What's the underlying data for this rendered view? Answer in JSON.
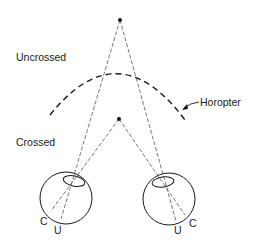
{
  "diagram": {
    "labels": {
      "uncrossed": "Uncrossed",
      "crossed": "Crossed",
      "horopter": "Horopter",
      "left_eye_c": "C",
      "left_eye_u": "U",
      "right_eye_u": "U",
      "right_eye_c": "C"
    },
    "points": {
      "far_point": {
        "x": 120,
        "y": 20
      },
      "near_point": {
        "x": 119,
        "y": 119
      }
    },
    "eyes": [
      {
        "name": "left-eye",
        "cx": 66,
        "cy": 198,
        "r": 26,
        "lens": {
          "cx": 74,
          "cy": 181,
          "rx": 11,
          "ry": 5
        }
      },
      {
        "name": "right-eye",
        "cx": 169,
        "cy": 199,
        "r": 26,
        "lens": {
          "cx": 163,
          "cy": 182,
          "rx": 11,
          "ry": 5
        }
      }
    ],
    "colors": {
      "line": "#1a1a1a",
      "background": "#ffffff"
    }
  }
}
